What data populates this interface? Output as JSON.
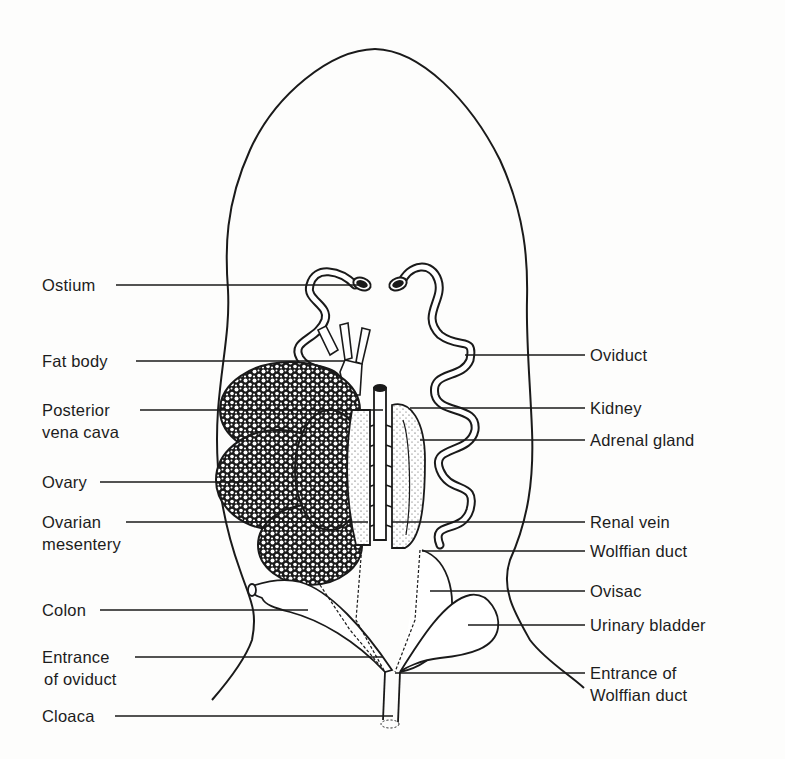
{
  "figure": {
    "line_color": "#1a1a1a",
    "background": "#fdfdfc"
  },
  "labels_left": [
    {
      "id": "ostium",
      "lines": [
        "Ostium"
      ]
    },
    {
      "id": "fat-body",
      "lines": [
        "Fat body"
      ]
    },
    {
      "id": "posterior-vena-cava",
      "lines": [
        "Posterior",
        "vena cava"
      ]
    },
    {
      "id": "ovary",
      "lines": [
        "Ovary"
      ]
    },
    {
      "id": "ovarian-mesentery",
      "lines": [
        "Ovarian",
        "mesentery"
      ]
    },
    {
      "id": "colon",
      "lines": [
        "Colon"
      ]
    },
    {
      "id": "entrance-of-oviduct",
      "lines": [
        "Entrance",
        "of oviduct"
      ]
    },
    {
      "id": "cloaca",
      "lines": [
        "Cloaca"
      ]
    }
  ],
  "labels_right": [
    {
      "id": "oviduct",
      "lines": [
        "Oviduct"
      ]
    },
    {
      "id": "kidney",
      "lines": [
        "Kidney"
      ]
    },
    {
      "id": "adrenal-gland",
      "lines": [
        "Adrenal gland"
      ]
    },
    {
      "id": "renal-vein",
      "lines": [
        "Renal vein"
      ]
    },
    {
      "id": "wolffian-duct",
      "lines": [
        "Wolffian duct"
      ]
    },
    {
      "id": "ovisac",
      "lines": [
        "Ovisac"
      ]
    },
    {
      "id": "urinary-bladder",
      "lines": [
        "Urinary bladder"
      ]
    },
    {
      "id": "entrance-of-wolffian-duct",
      "lines": [
        "Entrance of",
        "Wolffian duct"
      ]
    }
  ]
}
